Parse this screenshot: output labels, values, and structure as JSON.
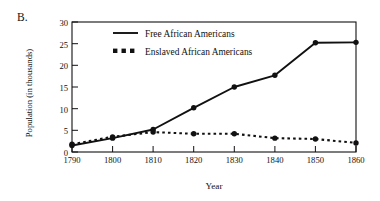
{
  "panel": {
    "label": "B."
  },
  "chart_data": {
    "type": "line",
    "title": "",
    "subtitle": "",
    "xlabel": "Year",
    "ylabel": "Population (in thousands)",
    "x": [
      1790,
      1800,
      1810,
      1820,
      1830,
      1840,
      1850,
      1860
    ],
    "xticks": [
      "1790",
      "1800",
      "1810",
      "1820",
      "1830",
      "1840",
      "1850",
      "1860"
    ],
    "yticks": [
      "0",
      "5",
      "10",
      "15",
      "20",
      "25",
      "30"
    ],
    "ytick_values": [
      0,
      5,
      10,
      15,
      20,
      25,
      30
    ],
    "xlim": [
      1790,
      1860
    ],
    "ylim": [
      0,
      30
    ],
    "grid": false,
    "legend_position": "upper-left-inside",
    "series": [
      {
        "name": "Free African Americans",
        "style": "solid",
        "marker": "circle",
        "color": "#111111",
        "values": [
          1.5,
          3.2,
          5.2,
          10.2,
          15.0,
          17.7,
          25.2,
          25.3
        ]
      },
      {
        "name": "Enslaved African Americans",
        "style": "dotted",
        "marker": "circle",
        "color": "#111111",
        "values": [
          1.8,
          3.5,
          4.6,
          4.2,
          4.2,
          3.2,
          3.0,
          2.1
        ]
      }
    ]
  },
  "legend": {
    "items": [
      {
        "label": "Free African Americans",
        "style": "solid"
      },
      {
        "label": "Enslaved African Americans",
        "style": "dotted"
      }
    ]
  }
}
